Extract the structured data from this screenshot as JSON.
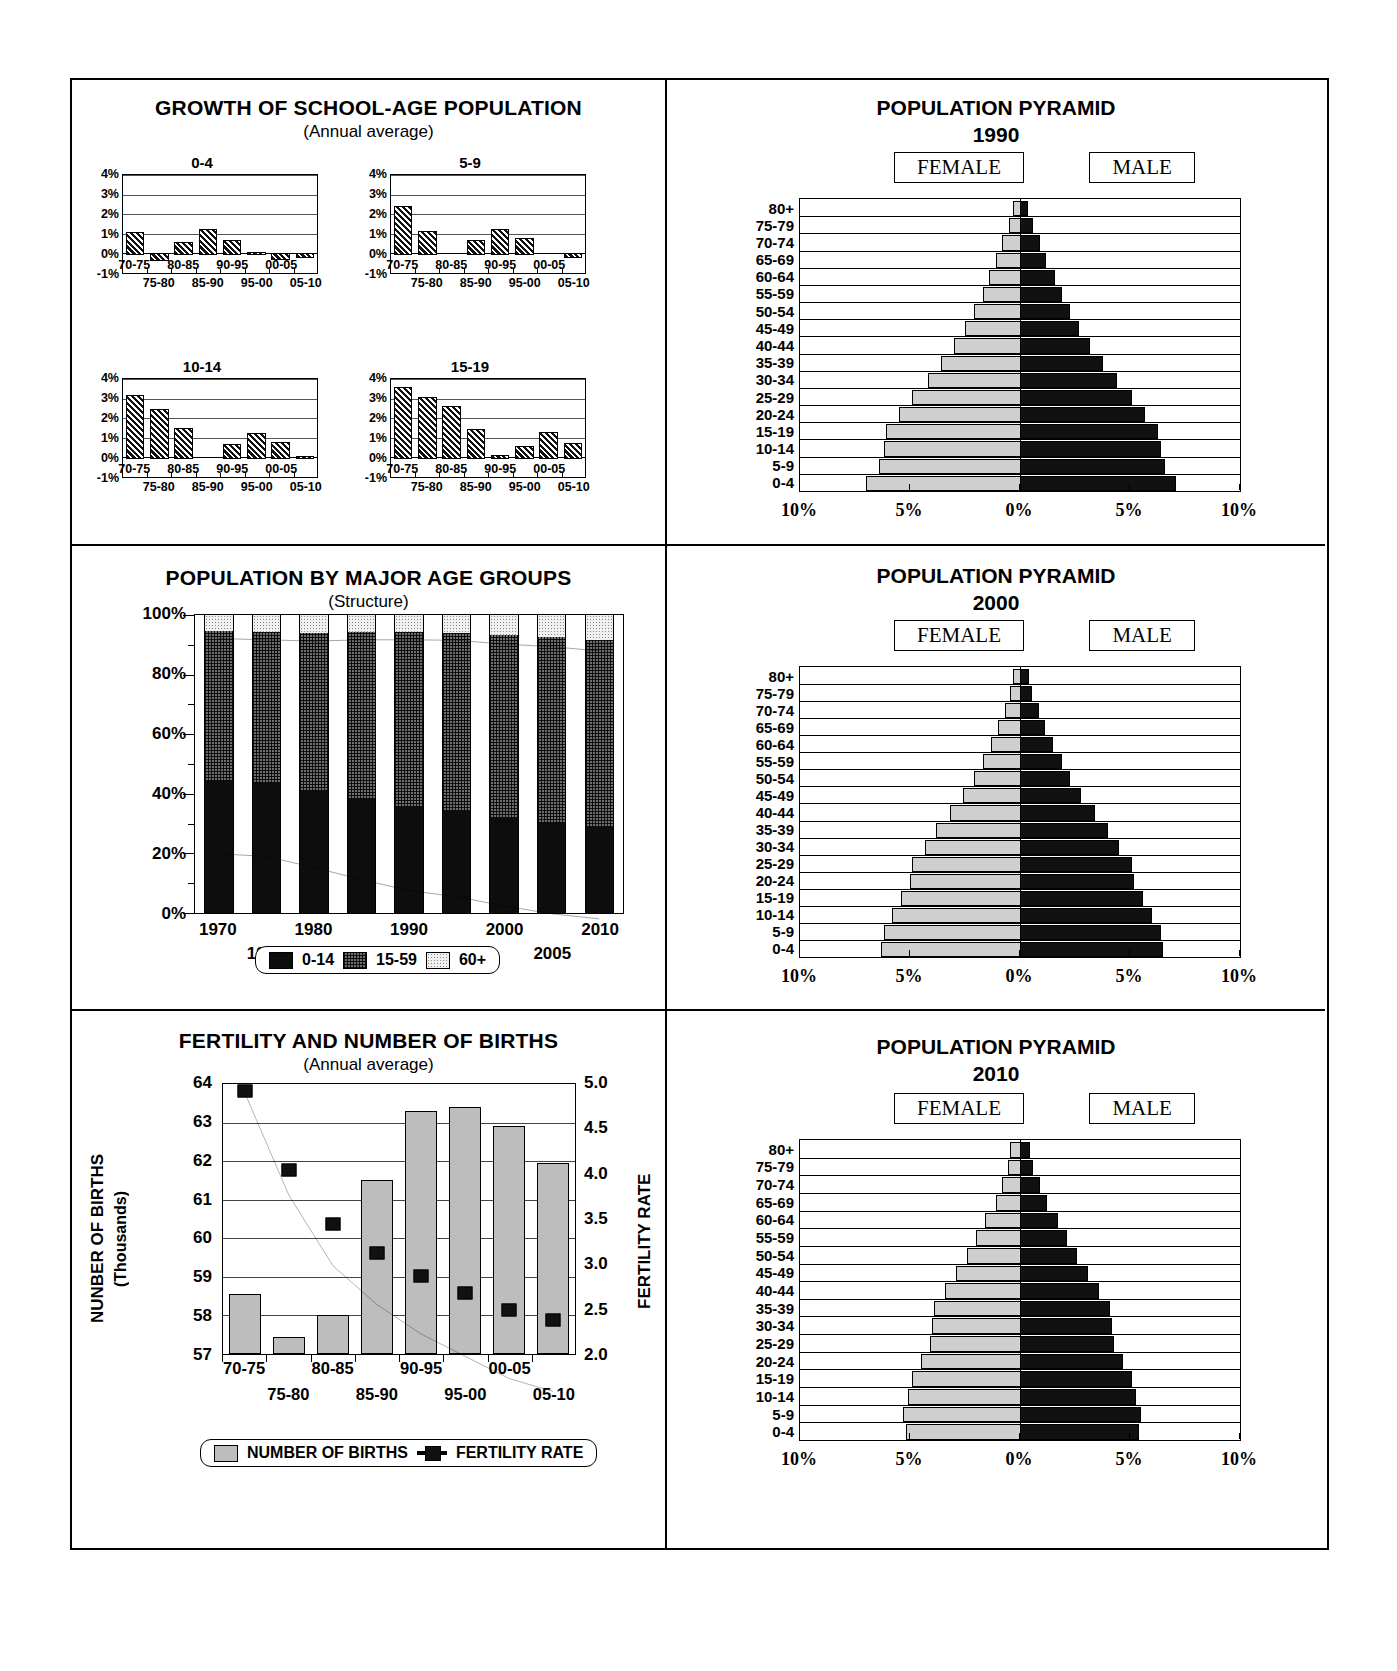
{
  "panels": {
    "growth": {
      "title": "GROWTH OF SCHOOL-AGE POPULATION",
      "subtitle": "(Annual average)",
      "y_ticks": [
        "4%",
        "3%",
        "2%",
        "1%",
        "0%",
        "-1%"
      ],
      "x_labels": [
        "70-75",
        "75-80",
        "80-85",
        "85-90",
        "90-95",
        "95-00",
        "00-05",
        "05-10"
      ]
    },
    "structure": {
      "title": "POPULATION BY MAJOR AGE GROUPS",
      "subtitle": "(Structure)",
      "y_ticks": [
        "100%",
        "80%",
        "60%",
        "40%",
        "20%",
        "0%"
      ],
      "x_labels": [
        "1970",
        "1975",
        "1980",
        "1985",
        "1990",
        "1995",
        "2000",
        "2005",
        "2010"
      ],
      "legend": [
        "0-14",
        "15-59",
        "60+"
      ]
    },
    "fertility": {
      "title": "FERTILITY AND NUMBER OF BIRTHS",
      "subtitle": "(Annual average)",
      "y_left_label": "NUNBER OF BIRTHS",
      "y_left_sub": "(Thousands)",
      "y_right_label": "FERTILITY RATE",
      "y_left_ticks": [
        "64",
        "63",
        "62",
        "61",
        "60",
        "59",
        "58",
        "57"
      ],
      "y_right_ticks": [
        "5.0",
        "4.5",
        "4.0",
        "3.5",
        "3.0",
        "2.5",
        "2.0"
      ],
      "x_labels": [
        "70-75",
        "75-80",
        "80-85",
        "85-90",
        "90-95",
        "95-00",
        "00-05",
        "05-10"
      ],
      "legend": [
        "NUMBER OF BIRTHS",
        "FERTILITY RATE"
      ]
    },
    "pyramid_common": {
      "title": "POPULATION PYRAMID",
      "female_label": "FEMALE",
      "male_label": "MALE",
      "age_labels": [
        "80+",
        "75-79",
        "70-74",
        "65-69",
        "60-64",
        "55-59",
        "50-54",
        "45-49",
        "40-44",
        "35-39",
        "30-34",
        "25-29",
        "20-24",
        "15-19",
        "10-14",
        "5-9",
        "0-4"
      ],
      "x_ticks": [
        "10%",
        "5%",
        "0%",
        "5%",
        "10%"
      ]
    },
    "pyramid_1990": {
      "year": "1990"
    },
    "pyramid_2000": {
      "year": "2000"
    },
    "pyramid_2010": {
      "year": "2010"
    }
  },
  "chart_data": [
    {
      "type": "bar",
      "id": "growth-0-4",
      "title": "0-4",
      "xlabel": "",
      "ylabel": "",
      "ylim": [
        -1,
        4
      ],
      "categories": [
        "70-75",
        "75-80",
        "80-85",
        "85-90",
        "90-95",
        "95-00",
        "00-05",
        "05-10"
      ],
      "values": [
        1.1,
        -0.3,
        0.6,
        1.25,
        0.7,
        0.05,
        -0.25,
        -0.15
      ],
      "grid": true
    },
    {
      "type": "bar",
      "id": "growth-5-9",
      "title": "5-9",
      "xlabel": "",
      "ylabel": "",
      "ylim": [
        -1,
        4
      ],
      "categories": [
        "70-75",
        "75-80",
        "80-85",
        "85-90",
        "90-95",
        "95-00",
        "00-05",
        "05-10"
      ],
      "values": [
        2.4,
        1.15,
        0.0,
        0.7,
        1.25,
        0.8,
        0.0,
        -0.15
      ],
      "grid": true
    },
    {
      "type": "bar",
      "id": "growth-10-14",
      "title": "10-14",
      "xlabel": "",
      "ylabel": "",
      "ylim": [
        -1,
        4
      ],
      "categories": [
        "70-75",
        "75-80",
        "80-85",
        "85-90",
        "90-95",
        "95-00",
        "00-05",
        "05-10"
      ],
      "values": [
        3.2,
        2.45,
        1.5,
        0.0,
        0.7,
        1.25,
        0.8,
        0.07
      ],
      "grid": true
    },
    {
      "type": "bar",
      "id": "growth-15-19",
      "title": "15-19",
      "xlabel": "",
      "ylabel": "",
      "ylim": [
        -1,
        4
      ],
      "categories": [
        "70-75",
        "75-80",
        "80-85",
        "85-90",
        "90-95",
        "95-00",
        "00-05",
        "05-10"
      ],
      "values": [
        3.6,
        3.1,
        2.6,
        1.45,
        0.1,
        0.6,
        1.3,
        0.75
      ],
      "grid": true
    },
    {
      "type": "bar",
      "id": "population-by-major-age-groups",
      "title": "POPULATION BY MAJOR AGE GROUPS",
      "subtitle": "(Structure)",
      "stacked": true,
      "xlabel": "",
      "ylabel": "",
      "ylim": [
        0,
        100
      ],
      "categories": [
        "1970",
        "1975",
        "1980",
        "1985",
        "1990",
        "1995",
        "2000",
        "2005",
        "2010"
      ],
      "series": [
        {
          "name": "0-14",
          "values": [
            44.2,
            43.6,
            41.0,
            38.2,
            35.6,
            34.2,
            32.0,
            30.2,
            29.0
          ]
        },
        {
          "name": "15-59",
          "values": [
            50.3,
            50.6,
            52.9,
            56.0,
            58.6,
            59.9,
            61.2,
            62.4,
            62.6
          ]
        },
        {
          "name": "60+",
          "values": [
            5.5,
            5.8,
            6.1,
            5.8,
            5.8,
            5.9,
            6.8,
            7.4,
            8.4
          ]
        }
      ],
      "legend_position": "bottom",
      "grid": false
    },
    {
      "type": "bar",
      "id": "fertility-and-number-of-births",
      "title": "FERTILITY AND NUMBER OF BIRTHS",
      "subtitle": "(Annual average)",
      "categories": [
        "70-75",
        "75-80",
        "80-85",
        "85-90",
        "90-95",
        "95-00",
        "00-05",
        "05-10"
      ],
      "ylabel": "NUNBER OF BIRTHS (Thousands)",
      "ylim": [
        57,
        64
      ],
      "y2label": "FERTILITY RATE",
      "y2lim": [
        2.0,
        5.0
      ],
      "series": [
        {
          "name": "NUMBER OF BIRTHS",
          "type": "bar",
          "axis": "left",
          "values": [
            58.5,
            57.4,
            57.95,
            61.45,
            63.25,
            63.35,
            62.85,
            61.9
          ]
        },
        {
          "name": "FERTILITY RATE",
          "type": "line",
          "axis": "right",
          "values": [
            4.92,
            4.05,
            3.45,
            3.12,
            2.87,
            2.68,
            2.49,
            2.38
          ]
        }
      ],
      "legend_position": "bottom",
      "grid": true
    },
    {
      "type": "bar",
      "id": "population-pyramid-1990",
      "title": "POPULATION PYRAMID 1990",
      "orientation": "horizontal",
      "categories": [
        "80+",
        "75-79",
        "70-74",
        "65-69",
        "60-64",
        "55-59",
        "50-54",
        "45-49",
        "40-44",
        "35-39",
        "30-34",
        "25-29",
        "20-24",
        "15-19",
        "10-14",
        "5-9",
        "0-4"
      ],
      "xlabel": "",
      "ylabel": "",
      "xlim": [
        -10,
        10
      ],
      "x_ticks": [
        "10%",
        "5%",
        "0%",
        "5%",
        "10%"
      ],
      "series": [
        {
          "name": "FEMALE",
          "side": "left",
          "values": [
            0.3,
            0.5,
            0.8,
            1.1,
            1.4,
            1.7,
            2.1,
            2.5,
            3.0,
            3.6,
            4.2,
            4.9,
            5.5,
            6.1,
            6.2,
            6.4,
            7.0
          ]
        },
        {
          "name": "MALE",
          "side": "right",
          "values": [
            0.25,
            0.5,
            0.8,
            1.1,
            1.5,
            1.8,
            2.2,
            2.6,
            3.1,
            3.7,
            4.3,
            5.0,
            5.6,
            6.2,
            6.3,
            6.5,
            7.0
          ]
        }
      ]
    },
    {
      "type": "bar",
      "id": "population-pyramid-2000",
      "title": "POPULATION PYRAMID 2000",
      "orientation": "horizontal",
      "categories": [
        "80+",
        "75-79",
        "70-74",
        "65-69",
        "60-64",
        "55-59",
        "50-54",
        "45-49",
        "40-44",
        "35-39",
        "30-34",
        "25-29",
        "20-24",
        "15-19",
        "10-14",
        "5-9",
        "0-4"
      ],
      "xlim": [
        -10,
        10
      ],
      "x_ticks": [
        "10%",
        "5%",
        "0%",
        "5%",
        "10%"
      ],
      "series": [
        {
          "name": "FEMALE",
          "side": "left",
          "values": [
            0.3,
            0.45,
            0.7,
            1.0,
            1.3,
            1.7,
            2.1,
            2.6,
            3.2,
            3.8,
            4.3,
            4.9,
            5.0,
            5.4,
            5.8,
            6.2,
            6.3
          ]
        },
        {
          "name": "MALE",
          "side": "right",
          "values": [
            0.3,
            0.45,
            0.75,
            1.05,
            1.4,
            1.8,
            2.2,
            2.7,
            3.3,
            3.9,
            4.4,
            5.0,
            5.1,
            5.5,
            5.9,
            6.3,
            6.4
          ]
        }
      ]
    },
    {
      "type": "bar",
      "id": "population-pyramid-2010",
      "title": "POPULATION PYRAMID 2010",
      "orientation": "horizontal",
      "categories": [
        "80+",
        "75-79",
        "70-74",
        "65-69",
        "60-64",
        "55-59",
        "50-54",
        "45-49",
        "40-44",
        "35-39",
        "30-34",
        "25-29",
        "20-24",
        "15-19",
        "10-14",
        "5-9",
        "0-4"
      ],
      "xlim": [
        -10,
        10
      ],
      "x_ticks": [
        "10%",
        "5%",
        "0%",
        "5%",
        "10%"
      ],
      "series": [
        {
          "name": "FEMALE",
          "side": "left",
          "values": [
            0.45,
            0.55,
            0.8,
            1.1,
            1.6,
            2.0,
            2.4,
            2.9,
            3.4,
            3.9,
            4.0,
            4.1,
            4.5,
            4.9,
            5.1,
            5.3,
            5.2
          ]
        },
        {
          "name": "MALE",
          "side": "right",
          "values": [
            0.35,
            0.5,
            0.8,
            1.15,
            1.65,
            2.05,
            2.5,
            3.0,
            3.5,
            4.0,
            4.1,
            4.2,
            4.6,
            5.0,
            5.2,
            5.4,
            5.3
          ]
        }
      ]
    }
  ]
}
